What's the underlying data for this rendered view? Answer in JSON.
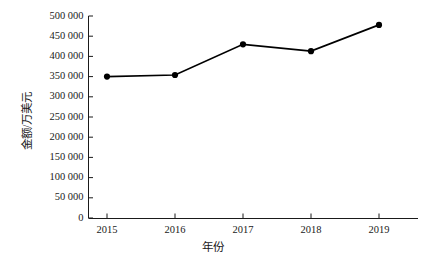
{
  "chart_data": {
    "type": "line",
    "title": "",
    "xlabel": "年份",
    "ylabel": "金额/万美元",
    "categories": [
      "2015",
      "2016",
      "2017",
      "2018",
      "2019"
    ],
    "values": [
      350000,
      354000,
      430000,
      413000,
      478000
    ],
    "series": [
      {
        "name": "金额",
        "values": [
          350000,
          354000,
          430000,
          413000,
          478000
        ],
        "color": "#000000",
        "marker": "filled-circle",
        "line_style": "solid"
      }
    ],
    "ylim": [
      0,
      500000
    ],
    "ytick_values": [
      0,
      50000,
      100000,
      150000,
      200000,
      250000,
      300000,
      350000,
      400000,
      450000,
      500000
    ],
    "ytick_labels": [
      "0",
      "50 000",
      "100 000",
      "150 000",
      "200 000",
      "250 000",
      "300 000",
      "350 000",
      "400 000",
      "450 000",
      "500 000"
    ],
    "xtick_labels": [
      "2015",
      "2016",
      "2017",
      "2018",
      "2019"
    ],
    "grid": false,
    "legend": false,
    "legend_position": "none",
    "axis_color": "#1a1a1a",
    "background_color": "#ffffff"
  },
  "axes": {
    "y_title": "金额/万美元",
    "x_title": "年份"
  }
}
